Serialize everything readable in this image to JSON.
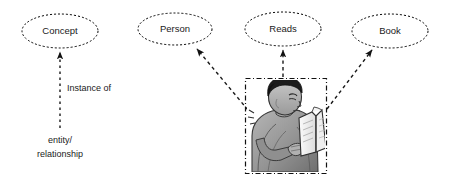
{
  "diagram": {
    "background_color": "#ffffff",
    "line_color": "#1a1a1a",
    "node_fill": "#ffffff",
    "nodes": [
      {
        "id": "concept",
        "label": "Concept",
        "shape": "ellipse",
        "cx": 60,
        "cy": 31,
        "rx": 38,
        "ry": 17
      },
      {
        "id": "person",
        "label": "Person",
        "shape": "ellipse",
        "cx": 175,
        "cy": 29,
        "rx": 37,
        "ry": 16
      },
      {
        "id": "reads",
        "label": "Reads",
        "shape": "ellipse",
        "cx": 283,
        "cy": 29,
        "rx": 38,
        "ry": 17
      },
      {
        "id": "book",
        "label": "Book",
        "shape": "ellipse",
        "cx": 390,
        "cy": 31,
        "rx": 38,
        "ry": 17
      }
    ],
    "figure": {
      "id": "person-reading-image",
      "alt": "person reading a book",
      "border_style": "dash-dot",
      "x": 245,
      "y": 78,
      "width": 82,
      "height": 96
    },
    "edges": [
      {
        "id": "edge-entity-to-concept",
        "from": "entity/relationship",
        "to": "Concept",
        "label": "Instance of",
        "style": "dashed",
        "arrow": "solid-triangle"
      },
      {
        "id": "edge-figure-to-person",
        "from": "person-reading-image",
        "to": "Person",
        "label": "",
        "style": "dashed",
        "arrow": "solid-triangle"
      },
      {
        "id": "edge-figure-to-reads",
        "from": "person-reading-image",
        "to": "Reads",
        "label": "",
        "style": "dashed",
        "arrow": "solid-triangle"
      },
      {
        "id": "edge-figure-to-book",
        "from": "person-reading-image",
        "to": "Book",
        "label": "",
        "style": "dashed",
        "arrow": "solid-triangle"
      }
    ],
    "labels": {
      "instance_of": "Instance of",
      "source_line1": "entity/",
      "source_line2": "relationship"
    }
  }
}
